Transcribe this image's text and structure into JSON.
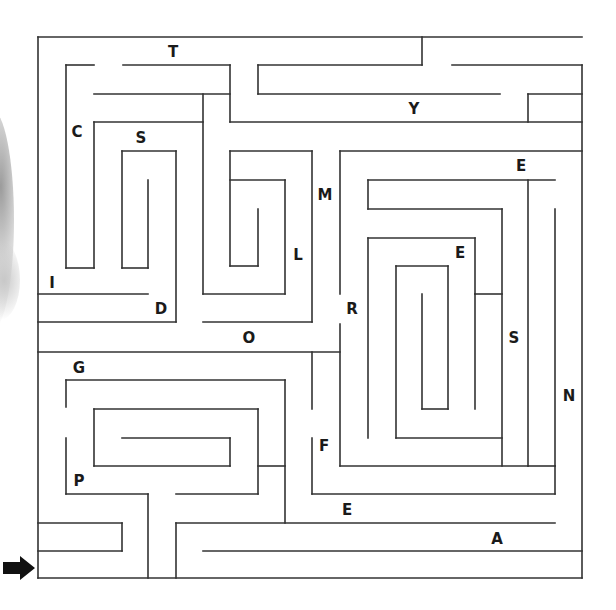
{
  "puzzle": {
    "type": "letter-maze",
    "start_arrow": {
      "icon": "right-arrow-icon",
      "x": 3,
      "y": 568,
      "color": "#111111"
    },
    "wall_color": "#333333",
    "bounds": {
      "left": 38,
      "top": 37,
      "right": 582,
      "bottom": 578
    },
    "letters": [
      {
        "char": "T",
        "x": 173,
        "y": 57
      },
      {
        "char": "Y",
        "x": 414,
        "y": 114
      },
      {
        "char": "C",
        "x": 77,
        "y": 137
      },
      {
        "char": "S",
        "x": 141,
        "y": 143
      },
      {
        "char": "E",
        "x": 521,
        "y": 171
      },
      {
        "char": "M",
        "x": 325,
        "y": 200
      },
      {
        "char": "E",
        "x": 460,
        "y": 258
      },
      {
        "char": "L",
        "x": 298,
        "y": 260
      },
      {
        "char": "I",
        "x": 52,
        "y": 288
      },
      {
        "char": "D",
        "x": 161,
        "y": 314
      },
      {
        "char": "R",
        "x": 352,
        "y": 314
      },
      {
        "char": "O",
        "x": 249,
        "y": 343
      },
      {
        "char": "S",
        "x": 514,
        "y": 343
      },
      {
        "char": "G",
        "x": 79,
        "y": 373
      },
      {
        "char": "N",
        "x": 569,
        "y": 401
      },
      {
        "char": "F",
        "x": 324,
        "y": 451
      },
      {
        "char": "P",
        "x": 79,
        "y": 486
      },
      {
        "char": "E",
        "x": 347,
        "y": 515
      },
      {
        "char": "A",
        "x": 497,
        "y": 544
      }
    ],
    "walls": [
      [
        38,
        37,
        582,
        37
      ],
      [
        38,
        37,
        38,
        578
      ],
      [
        38,
        578,
        582,
        578
      ],
      [
        582,
        65,
        582,
        578
      ],
      [
        422,
        37,
        422,
        65
      ],
      [
        258,
        65,
        422,
        65
      ],
      [
        258,
        65,
        258,
        94
      ],
      [
        452,
        65,
        582,
        65
      ],
      [
        66,
        65,
        94,
        65
      ],
      [
        66,
        65,
        66,
        268
      ],
      [
        66,
        268,
        94,
        268
      ],
      [
        123,
        65,
        230,
        65
      ],
      [
        230,
        65,
        230,
        122
      ],
      [
        94,
        94,
        230,
        94
      ],
      [
        258,
        94,
        500,
        94
      ],
      [
        528,
        94,
        582,
        94
      ],
      [
        528,
        94,
        528,
        122
      ],
      [
        230,
        122,
        582,
        122
      ],
      [
        94,
        122,
        203,
        122
      ],
      [
        94,
        122,
        94,
        268
      ],
      [
        203,
        94,
        203,
        294
      ],
      [
        203,
        294,
        285,
        294
      ],
      [
        122,
        151,
        176,
        151
      ],
      [
        122,
        151,
        122,
        268
      ],
      [
        122,
        268,
        148,
        268
      ],
      [
        148,
        180,
        148,
        268
      ],
      [
        176,
        151,
        176,
        322
      ],
      [
        38,
        294,
        148,
        294
      ],
      [
        38,
        322,
        176,
        322
      ],
      [
        230,
        151,
        312,
        151
      ],
      [
        230,
        151,
        230,
        266
      ],
      [
        230,
        180,
        285,
        180
      ],
      [
        230,
        266,
        258,
        266
      ],
      [
        258,
        209,
        258,
        266
      ],
      [
        285,
        180,
        285,
        294
      ],
      [
        312,
        151,
        312,
        322
      ],
      [
        203,
        322,
        312,
        322
      ],
      [
        340,
        151,
        582,
        151
      ],
      [
        340,
        151,
        340,
        294
      ],
      [
        368,
        180,
        555,
        180
      ],
      [
        368,
        180,
        368,
        209
      ],
      [
        368,
        209,
        502,
        209
      ],
      [
        528,
        180,
        528,
        466
      ],
      [
        555,
        209,
        555,
        466
      ],
      [
        502,
        209,
        502,
        466
      ],
      [
        368,
        238,
        475,
        238
      ],
      [
        368,
        238,
        368,
        438
      ],
      [
        475,
        238,
        475,
        294
      ],
      [
        475,
        294,
        502,
        294
      ],
      [
        396,
        266,
        448,
        266
      ],
      [
        396,
        266,
        396,
        438
      ],
      [
        448,
        266,
        448,
        409
      ],
      [
        422,
        294,
        422,
        409
      ],
      [
        422,
        409,
        448,
        409
      ],
      [
        475,
        294,
        475,
        409
      ],
      [
        396,
        438,
        502,
        438
      ],
      [
        340,
        324,
        340,
        466
      ],
      [
        340,
        466,
        528,
        466
      ],
      [
        38,
        352,
        340,
        352
      ],
      [
        312,
        352,
        312,
        409
      ],
      [
        312,
        438,
        312,
        494
      ],
      [
        312,
        494,
        555,
        494
      ],
      [
        555,
        466,
        555,
        494
      ],
      [
        528,
        466,
        555,
        466
      ],
      [
        66,
        380,
        285,
        380
      ],
      [
        66,
        380,
        66,
        407
      ],
      [
        66,
        438,
        66,
        494
      ],
      [
        285,
        380,
        285,
        523
      ],
      [
        94,
        409,
        258,
        409
      ],
      [
        94,
        409,
        94,
        466
      ],
      [
        94,
        466,
        230,
        466
      ],
      [
        122,
        438,
        230,
        438
      ],
      [
        230,
        438,
        230,
        466
      ],
      [
        258,
        409,
        258,
        494
      ],
      [
        258,
        466,
        285,
        466
      ],
      [
        66,
        494,
        148,
        494
      ],
      [
        148,
        494,
        148,
        578
      ],
      [
        176,
        494,
        258,
        494
      ],
      [
        38,
        523,
        122,
        523
      ],
      [
        122,
        523,
        122,
        551
      ],
      [
        38,
        551,
        122,
        551
      ],
      [
        176,
        523,
        555,
        523
      ],
      [
        176,
        523,
        176,
        578
      ],
      [
        203,
        551,
        582,
        551
      ]
    ]
  }
}
